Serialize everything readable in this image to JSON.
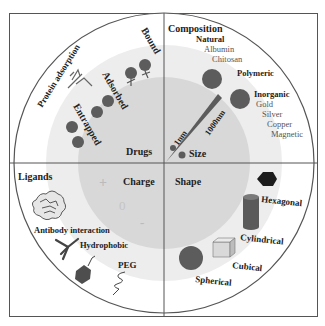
{
  "diagram": {
    "quadrants": {
      "top_left": {
        "title": "Drugs",
        "items": [
          "Bound",
          "Adsorbed",
          "Entrapped",
          "Protein adsorption"
        ]
      },
      "top_right": {
        "title": "Composition",
        "size_label": "Size",
        "size_min": "1nm",
        "size_max": "1000nm",
        "groups": [
          {
            "name": "Natural",
            "items": [
              "Albumin",
              "Chitosan"
            ]
          },
          {
            "name": "Polymeric",
            "items": []
          },
          {
            "name": "Inorganic",
            "items": [
              "Gold",
              "Silver",
              "Copper",
              "Magnetic"
            ]
          }
        ]
      },
      "bottom_left": {
        "title": "Ligands",
        "charge_label": "Charge",
        "charge_symbols": [
          "+",
          "0",
          "-"
        ],
        "items": [
          "Antibody interaction",
          "Hydrophobic",
          "PEG"
        ]
      },
      "bottom_right": {
        "title": "Shape",
        "items": [
          "Hexagonal",
          "Cylindrical",
          "Cubical",
          "Spherical"
        ]
      }
    },
    "colors": {
      "outer_ring": "#ffffff",
      "middle_ring": "#ececec",
      "inner_disc": "#d6d6d6",
      "particle": "#5c5c5c",
      "line": "#555555"
    }
  }
}
